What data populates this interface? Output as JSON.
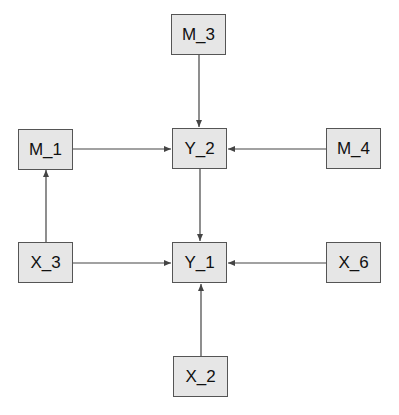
{
  "nodes": [
    {
      "id": "M_3",
      "label": "M_3",
      "x": 171,
      "y": 14
    },
    {
      "id": "M_1",
      "label": "M_1",
      "x": 18,
      "y": 129
    },
    {
      "id": "Y_2",
      "label": "Y_2",
      "x": 172,
      "y": 128
    },
    {
      "id": "M_4",
      "label": "M_4",
      "x": 326,
      "y": 128
    },
    {
      "id": "X_3",
      "label": "X_3",
      "x": 18,
      "y": 242
    },
    {
      "id": "Y_1",
      "label": "Y_1",
      "x": 172,
      "y": 242
    },
    {
      "id": "X_6",
      "label": "X_6",
      "x": 326,
      "y": 242
    },
    {
      "id": "X_2",
      "label": "X_2",
      "x": 173,
      "y": 356
    }
  ],
  "edges": [
    {
      "from": "M_3",
      "to": "Y_2"
    },
    {
      "from": "M_1",
      "to": "Y_2"
    },
    {
      "from": "M_4",
      "to": "Y_2"
    },
    {
      "from": "Y_2",
      "to": "Y_1"
    },
    {
      "from": "X_3",
      "to": "M_1"
    },
    {
      "from": "X_3",
      "to": "Y_1"
    },
    {
      "from": "X_6",
      "to": "Y_1"
    },
    {
      "from": "X_2",
      "to": "Y_1"
    }
  ],
  "colors": {
    "node_fill": "#e6e6e6",
    "node_border": "#555555",
    "edge": "#444444"
  }
}
